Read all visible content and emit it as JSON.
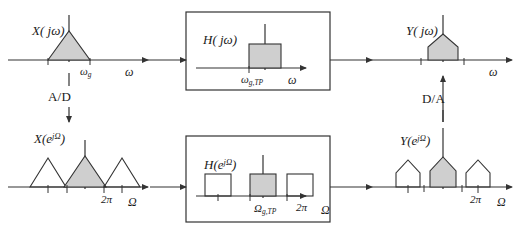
{
  "diagram": {
    "background": "#ffffff",
    "stroke_color": "#333333",
    "shade_color": "#cfcfcf"
  },
  "blocks": {
    "x_continuous": {
      "signal_label_base": "X",
      "signal_label_arg": "( jω)",
      "axis_label": "ω",
      "tick_label": "ω",
      "tick_sub": "g",
      "shape": "triangle",
      "shaded": true
    },
    "h_continuous": {
      "signal_label_base": "H",
      "signal_label_arg": "( jω)",
      "axis_label": "ω",
      "tick_label": "ω",
      "tick_sub": "g,TP",
      "shape": "rectangle",
      "shaded": true
    },
    "y_continuous": {
      "signal_label_base": "Y",
      "signal_label_arg": "( jω)",
      "axis_label": "ω",
      "shape": "house",
      "shaded": true
    },
    "x_discrete": {
      "signal_label_base": "X",
      "signal_label_arg": "(e",
      "signal_label_exp": "jΩ",
      "signal_label_close": ")",
      "axis_label": "Ω",
      "tick_label": "2π",
      "shape": "triangle",
      "replicas": 3,
      "shaded_index": 1
    },
    "h_discrete": {
      "signal_label_base": "H",
      "signal_label_arg": "(e",
      "signal_label_exp": "jΩ",
      "signal_label_close": ")",
      "axis_label": "Ω",
      "tick_label_main": "Ω",
      "tick_sub": "g,TP",
      "tick_label": "2π",
      "shape": "rectangle",
      "replicas": 3,
      "shaded_index": 1
    },
    "y_discrete": {
      "signal_label_base": "Y",
      "signal_label_arg": "(e",
      "signal_label_exp": "jΩ",
      "signal_label_close": ")",
      "axis_label": "Ω",
      "tick_label": "2π",
      "shape": "house",
      "replicas": 3,
      "shaded_index": 1
    }
  },
  "converters": {
    "ad": {
      "label": "A/D",
      "direction": "down"
    },
    "da": {
      "label": "D/A",
      "direction": "up"
    }
  }
}
